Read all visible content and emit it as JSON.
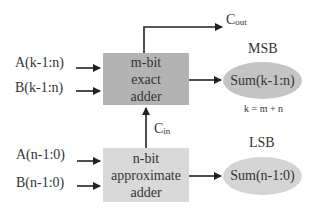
{
  "diagram": {
    "inputs": {
      "a_high": "A(k-1:n)",
      "b_high": "B(k-1:n)",
      "a_low": "A(n-1:0)",
      "b_low": "B(n-1:0)"
    },
    "exact_adder": {
      "line1": "m-bit",
      "line2": "exact",
      "line3": "adder",
      "fill": "#b3b3b3"
    },
    "approx_adder": {
      "line1": "n-bit",
      "line2": "approximate",
      "line3": "adder",
      "fill": "#d9d9d9"
    },
    "carry_out": {
      "main": "C",
      "sub": "out"
    },
    "carry_in": {
      "main": "C",
      "sub": "in"
    },
    "msb": {
      "title": "MSB",
      "sum": "Sum(k-1:n)",
      "fill": "#c4c4c4"
    },
    "lsb": {
      "title": "LSB",
      "sum": "Sum(n-1:0)",
      "fill": "#d4d4d4"
    },
    "equation": "k = m + n"
  }
}
